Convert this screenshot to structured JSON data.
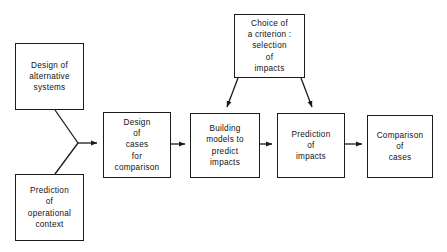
{
  "diagram": {
    "type": "flowchart",
    "title": "",
    "background_color": "#ffffff",
    "line_color": "#1b1b1b",
    "text_color": "#111111",
    "nodes": [
      {
        "id": "design-alternative-systems",
        "label": "Design of\nalternative\nsystems",
        "x": 15,
        "y": 43,
        "w": 69,
        "h": 67
      },
      {
        "id": "prediction-operational-context",
        "label": "Prediction\nof\noperational\ncontext",
        "x": 15,
        "y": 174,
        "w": 69,
        "h": 67
      },
      {
        "id": "design-cases-comparison",
        "label": "Design\nof\ncases\nfor\ncomparison",
        "x": 103,
        "y": 112,
        "w": 68,
        "h": 66
      },
      {
        "id": "building-models-predict-impacts",
        "label": "Building\nmodels to\npredict\nimpacts",
        "x": 190,
        "y": 113,
        "w": 70,
        "h": 65
      },
      {
        "id": "choice-of-criterion",
        "label": "Choice of\na criterion :\nselection\nof\nimpacts",
        "x": 234,
        "y": 14,
        "w": 71,
        "h": 64
      },
      {
        "id": "prediction-of-impacts",
        "label": "Prediction\nof\nimpacts",
        "x": 277,
        "y": 113,
        "w": 68,
        "h": 65
      },
      {
        "id": "comparison-of-cases",
        "label": "Comparison\nof\ncases",
        "x": 367,
        "y": 115,
        "w": 66,
        "h": 63
      }
    ],
    "connectors": [
      {
        "id": "alt-systems-to-merge",
        "kind": "line",
        "from": "design-alternative-systems",
        "to": "merge-vertex",
        "arrowhead": false
      },
      {
        "id": "operational-context-to-merge",
        "kind": "line",
        "from": "prediction-operational-context",
        "to": "merge-vertex",
        "arrowhead": false
      },
      {
        "id": "merge-to-design-cases",
        "kind": "arrow",
        "from": "merge-vertex",
        "to": "design-cases-comparison",
        "arrowhead": true
      },
      {
        "id": "design-cases-to-building-models",
        "kind": "arrow",
        "from": "design-cases-comparison",
        "to": "building-models-predict-impacts",
        "arrowhead": true
      },
      {
        "id": "building-models-to-prediction",
        "kind": "arrow",
        "from": "building-models-predict-impacts",
        "to": "prediction-of-impacts",
        "arrowhead": true
      },
      {
        "id": "prediction-to-comparison",
        "kind": "arrow",
        "from": "prediction-of-impacts",
        "to": "comparison-of-cases",
        "arrowhead": true
      },
      {
        "id": "criterion-to-building-models",
        "kind": "arrow",
        "from": "choice-of-criterion",
        "to": "building-models-predict-impacts",
        "arrowhead": true
      },
      {
        "id": "criterion-to-prediction",
        "kind": "arrow",
        "from": "choice-of-criterion",
        "to": "prediction-of-impacts",
        "arrowhead": true
      }
    ]
  }
}
